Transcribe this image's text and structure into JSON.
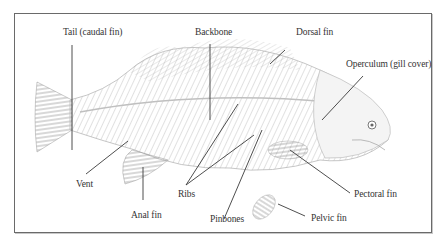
{
  "diagram": {
    "labels": {
      "tail": "Tail (caudal fin)",
      "backbone": "Backbone",
      "dorsal_fin": "Dorsal fin",
      "operculum": "Operculum (gill cover)",
      "vent": "Vent",
      "anal_fin": "Anal fin",
      "ribs": "Ribs",
      "pinbones": "Pinbones",
      "pectoral_fin": "Pectoral fin",
      "pelvic_fin": "Pelvic fin"
    },
    "colors": {
      "line": "#3a3a3a",
      "sketch": "#9a9a9a",
      "frame": "#6a6a6a"
    }
  }
}
